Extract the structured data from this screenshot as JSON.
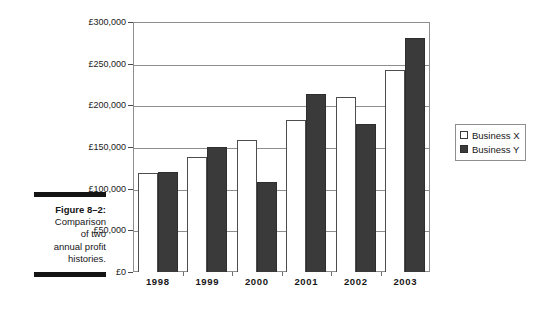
{
  "figure": {
    "label": "Figure 8–2:",
    "caption_lines": [
      "Comparison",
      "of two",
      "annual profit",
      "histories."
    ]
  },
  "legend": {
    "position": "right",
    "entries": [
      {
        "label": "Business X",
        "swatch": "white-square-swatch",
        "color": "#ffffff"
      },
      {
        "label": "Business Y",
        "swatch": "dark-square-swatch",
        "color": "#3a3a3a"
      }
    ]
  },
  "chart_data": {
    "type": "bar",
    "title": "",
    "xlabel": "",
    "ylabel": "",
    "categories": [
      "1998",
      "1999",
      "2000",
      "2001",
      "2002",
      "2003"
    ],
    "series": [
      {
        "name": "Business X",
        "color": "#ffffff",
        "values": [
          119000,
          138000,
          158000,
          182000,
          210000,
          242000
        ]
      },
      {
        "name": "Business Y",
        "color": "#3a3a3a",
        "values": [
          120000,
          150000,
          108000,
          214000,
          178000,
          281000
        ]
      }
    ],
    "ylim": [
      0,
      300000
    ],
    "ytick_values": [
      0,
      50000,
      100000,
      150000,
      200000,
      250000,
      300000
    ],
    "ytick_labels": [
      "£0",
      "£50,000",
      "£100,000",
      "£150,000",
      "£200,000",
      "£250,000",
      "£300,000"
    ],
    "grid": true,
    "grid_axis": "y",
    "legend_position": "right"
  }
}
